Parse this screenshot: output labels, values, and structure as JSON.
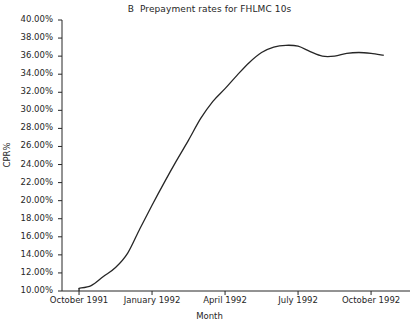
{
  "chart_data": {
    "type": "line",
    "title": "B  Prepayment rates for FHLMC 10s",
    "xlabel": "Month",
    "ylabel": "CPR%",
    "grid": false,
    "legend": null,
    "ylim": [
      10,
      40
    ],
    "ytick_labels": [
      "40.00%",
      "38.00%",
      "36.00%",
      "34.00%",
      "32.00%",
      "30.00%",
      "28.00%",
      "26.00%",
      "24.00%",
      "22.00%",
      "20.00%",
      "18.00%",
      "16.00%",
      "14.00%",
      "12.00%",
      "10.00%"
    ],
    "ytick_values": [
      40,
      38,
      36,
      34,
      32,
      30,
      28,
      26,
      24,
      22,
      20,
      18,
      16,
      14,
      12,
      10
    ],
    "xtick_labels": [
      "October 1991",
      "January 1992",
      "April 1992",
      "July 1992",
      "October 1992"
    ],
    "xtick_values": [
      0,
      3,
      6,
      9,
      12
    ],
    "xlim": [
      -0.7,
      13.6
    ],
    "series": [
      {
        "name": "FHLMC 10s CPR",
        "color": "#262626",
        "x": [
          0,
          0.5,
          1,
          1.5,
          2,
          2.5,
          3,
          3.5,
          4,
          4.5,
          5,
          5.5,
          6,
          6.5,
          7,
          7.5,
          8,
          8.5,
          9,
          9.5,
          10,
          10.5,
          11,
          11.5,
          12,
          12.5
        ],
        "values": [
          10.3,
          10.6,
          11.6,
          12.6,
          14.2,
          16.9,
          19.5,
          22.0,
          24.4,
          26.7,
          29.1,
          31.0,
          32.4,
          33.9,
          35.3,
          36.4,
          37.0,
          37.2,
          37.1,
          36.5,
          36.0,
          36.0,
          36.3,
          36.4,
          36.3,
          36.1
        ]
      }
    ]
  }
}
